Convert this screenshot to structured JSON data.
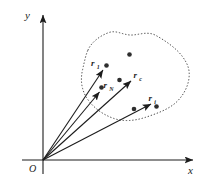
{
  "figure": {
    "type": "vector-diagram",
    "background_color": "#ffffff",
    "ink_color": "#1c1c1c",
    "particle_color": "#2e2e2e",
    "axes": {
      "x_label": "x",
      "y_label": "y",
      "origin_label": "O"
    },
    "vectors": [
      {
        "id": "r1",
        "label": "r",
        "subscript": "1"
      },
      {
        "id": "rN",
        "label": "r",
        "subscript": "N"
      },
      {
        "id": "rc",
        "label": "r",
        "subscript": "c"
      },
      {
        "id": "ri",
        "label": "r",
        "subscript": "i"
      }
    ],
    "particle_count": 6,
    "boundary_style": "dotted"
  }
}
